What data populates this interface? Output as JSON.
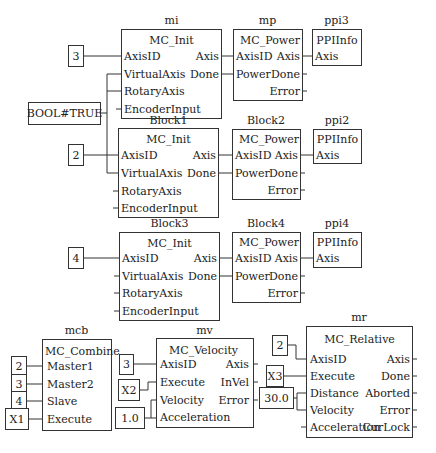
{
  "blocks": {
    "mi": {
      "instance": "mi",
      "type": "MC_Init",
      "inputs": [
        "AxisID",
        "VirtualAxis",
        "RotaryAxis",
        "EncoderInput"
      ],
      "outputs": [
        "Axis",
        "Done"
      ]
    },
    "mp": {
      "instance": "mp",
      "type": "MC_Power",
      "inputs": [
        "AxisID",
        "Power"
      ],
      "outputs": [
        "Axis",
        "Done",
        "Error"
      ]
    },
    "ppi3": {
      "instance": "ppi3",
      "type": "PPIInfo",
      "inputs": [
        "Axis"
      ]
    },
    "block1": {
      "instance": "Block1",
      "type": "MC_Init",
      "inputs": [
        "AxisID",
        "VirtualAxis",
        "RotaryAxis",
        "EncoderInput"
      ],
      "outputs": [
        "Axis",
        "Done"
      ]
    },
    "block2": {
      "instance": "Block2",
      "type": "MC_Power",
      "inputs": [
        "AxisID",
        "Power"
      ],
      "outputs": [
        "Axis",
        "Done",
        "Error"
      ]
    },
    "ppi2": {
      "instance": "ppi2",
      "type": "PPIInfo",
      "inputs": [
        "Axis"
      ]
    },
    "block3": {
      "instance": "Block3",
      "type": "MC_Init",
      "inputs": [
        "AxisID",
        "VirtualAxis",
        "RotaryAxis",
        "EncoderInput"
      ],
      "outputs": [
        "Axis",
        "Done"
      ]
    },
    "block4": {
      "instance": "Block4",
      "type": "MC_Power",
      "inputs": [
        "AxisID",
        "Power"
      ],
      "outputs": [
        "Axis",
        "Done",
        "Error"
      ]
    },
    "ppi4": {
      "instance": "ppi4",
      "type": "PPIInfo",
      "inputs": [
        "Axis"
      ]
    },
    "mcb": {
      "instance": "mcb",
      "type": "MC_Combine",
      "inputs": [
        "Master1",
        "Master2",
        "Slave",
        "Execute"
      ]
    },
    "mv": {
      "instance": "mv",
      "type": "MC_Velocity",
      "inputs": [
        "AxisID",
        "Execute",
        "Velocity",
        "Acceleration"
      ],
      "outputs": [
        "Axis",
        "InVel",
        "Error"
      ]
    },
    "mr": {
      "instance": "mr",
      "type": "MC_Relative",
      "inputs": [
        "AxisID",
        "Execute",
        "Distance",
        "Velocity",
        "Acceleration"
      ],
      "outputs": [
        "Axis",
        "Done",
        "Aborted",
        "Error",
        "CurLock"
      ]
    }
  },
  "constants": {
    "mi_axis": "3",
    "bool_true": "BOOL#TRUE",
    "block1_axis": "2",
    "block3_axis": "4",
    "mcb_master1": "2",
    "mcb_master2": "3",
    "mcb_slave": "4",
    "mcb_execute": "X1",
    "mv_axis": "3",
    "mv_execute": "X2",
    "mv_vel_acc": "1.0",
    "mr_axis": "2",
    "mr_execute": "X3",
    "mr_dist_vel": "30.0"
  }
}
